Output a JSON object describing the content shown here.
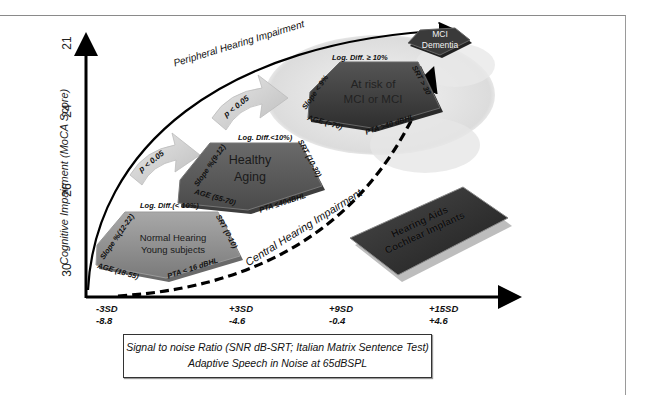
{
  "figure": {
    "y_axis": {
      "label": "Cognitive Impairment (MoCA Score)",
      "ticks": [
        "21",
        "24",
        "26",
        "30"
      ]
    },
    "x_axis": {
      "ticks": [
        {
          "sd": "-3SD",
          "value": "-8.8"
        },
        {
          "sd": "+3SD",
          "value": "-4.6"
        },
        {
          "sd": "+9SD",
          "value": "-0.4"
        },
        {
          "sd": "+15SD",
          "value": "+4.6"
        }
      ],
      "caption_line1": "Signal to noise Ratio (SNR dB-SRT; Italian Matrix Sentence Test)",
      "caption_line2": "Adaptive Speech in Noise at 65dBSPL"
    },
    "curves": {
      "peripheral": "Peripheral Hearing Impairment",
      "central": "Central Hearing Impairment"
    },
    "stages": [
      {
        "name_line1": "Normal Hearing",
        "name_line2": "Young subjects",
        "log_diff": "Log. Diff.(< 10%)",
        "srt": "SRT (0-10)",
        "pta": "PTA < 16 dBHL",
        "age": "AGE (18-55)",
        "slope": "Slope %(12-22)"
      },
      {
        "name_line1": "Healthy",
        "name_line2": "Aging",
        "log_diff": "Log. Diff.<10%)",
        "srt": "SRT (10-30)",
        "pta": "PTA ≤40dBHL",
        "age": "AGE (55-70)",
        "slope": "Slope %(9-12)"
      },
      {
        "name_line1": "At risk of",
        "name_line2": "MCI or MCI",
        "log_diff": "Log. Diff. ≥ 10%",
        "srt": "SRT > 30",
        "pta": "PTA >40 dBHL",
        "age": "AGE (>70)",
        "slope": "Slope < 9%"
      },
      {
        "name_line1": "MCI",
        "name_line2": "Dementia"
      }
    ],
    "transitions": [
      "p < 0.05",
      "p < 0.05"
    ],
    "intervention": {
      "line1": "Hearing Aids",
      "line2": "Cochlear Implants"
    },
    "colors": {
      "pentagon_light": "#8c8c8c",
      "pentagon_mid": "#5e5e5e",
      "pentagon_dark": "#3a3a3a",
      "axis": "#000000",
      "frame": "#8a8a8a"
    }
  }
}
